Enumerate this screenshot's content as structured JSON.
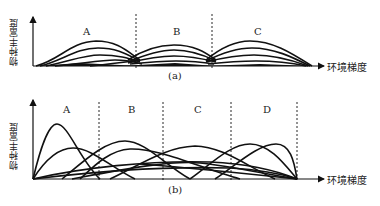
{
  "panels": [
    {
      "id": "a",
      "caption": "(a)",
      "y_axis_label": "物种丰富度",
      "x_axis_label": "环境梯度",
      "zones": [
        "A",
        "B",
        "C"
      ],
      "description": "Three discrete communities (A, B, C) along an environmental gradient; species curves within each zone share nearly identical boundaries, meeting at dashed boundary lines."
    },
    {
      "id": "b",
      "caption": "(b)",
      "y_axis_label": "物种丰富度",
      "x_axis_label": "环境梯度",
      "zones": [
        "A",
        "B",
        "C",
        "D"
      ],
      "description": "Continuum of species along an environmental gradient; species distribution curves overlap broadly and independently across zones A–D."
    }
  ],
  "colors": {
    "line": "#111111",
    "background": "#ffffff"
  }
}
